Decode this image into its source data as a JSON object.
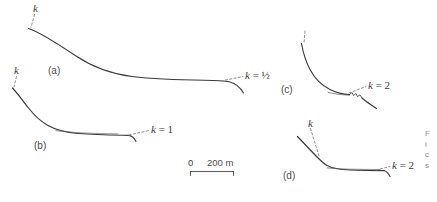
{
  "figure": {
    "type": "line-profiles",
    "background_color": "#ffffff",
    "line_color": "#3a3a3a",
    "dash_color": "#8a8a8a",
    "text_color": "#3c3c3c"
  },
  "panels": [
    {
      "id": "a",
      "label": "(a)",
      "k_label": "k",
      "k_value_label": "k = ½",
      "k_value": "0.5"
    },
    {
      "id": "b",
      "label": "(b)",
      "k_label": "k",
      "k_value_label": "k = 1",
      "k_value": "1"
    },
    {
      "id": "c",
      "label": "(c)",
      "k_label": "",
      "k_value_label": "k = 2",
      "k_value": "2"
    },
    {
      "id": "d",
      "label": "(d)",
      "k_label": "k",
      "k_value_label": "k = 2",
      "k_value": "2"
    }
  ],
  "scale_bar": {
    "start_label": "0",
    "end_label": "200 m",
    "length_value": "200",
    "unit": "m"
  },
  "caption_sliver": {
    "lines": [
      "F",
      "i",
      "c",
      "s"
    ]
  }
}
